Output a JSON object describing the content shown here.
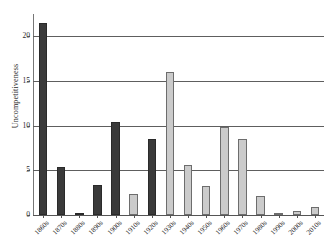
{
  "chart_data": {
    "type": "bar",
    "title": "",
    "subtitle": "",
    "xlabel": "",
    "ylabel": "Uncompetitiveness",
    "categories": [
      "1860s",
      "1870s",
      "1880s",
      "1890s",
      "1900s",
      "1910s",
      "1920s",
      "1930s",
      "1940s",
      "1950s",
      "1960s",
      "1970s",
      "1980s",
      "1990s",
      "2000s",
      "2010s"
    ],
    "values": [
      21.5,
      5.4,
      0.15,
      3.4,
      10.4,
      2.3,
      8.5,
      16.0,
      5.6,
      3.2,
      9.8,
      8.5,
      2.1,
      0.2,
      0.5,
      0.9
    ],
    "bar_colors": [
      "dark",
      "dark",
      "dark",
      "dark",
      "dark",
      "light",
      "dark",
      "light",
      "light",
      "light",
      "light",
      "light",
      "light",
      "light",
      "light",
      "light"
    ],
    "ylim": [
      0,
      22.5
    ],
    "yticks": [
      0,
      5,
      10,
      15,
      20
    ],
    "ytick_labels": [
      "0",
      "5",
      "10",
      "15",
      "20"
    ],
    "grid": "horizontal",
    "legend": "none",
    "colors": {
      "dark_bar": "#3a3a3a",
      "light_bar": "#cbcbcb",
      "light_bar_edge": "#6d6d6d",
      "gridline": "#5e5e5e",
      "axis": "#555555",
      "text": "#2b2b2b",
      "background": "#ffffff"
    }
  }
}
